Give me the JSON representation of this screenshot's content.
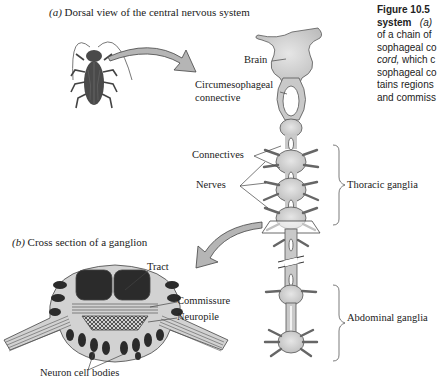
{
  "figure": {
    "number": "Figure 10.5",
    "caption_lines": [
      {
        "bold": "Figure 10.5",
        "text": ""
      },
      {
        "bold": "system",
        "italic": "(a)",
        "text": ""
      },
      {
        "text": "of a chain of"
      },
      {
        "text": "sophageal co"
      },
      {
        "italic": "cord,",
        "text": " which c"
      },
      {
        "text": "sophageal co"
      },
      {
        "text": "tains regions"
      },
      {
        "text": "and commiss"
      }
    ]
  },
  "panel_a": {
    "letter": "(a)",
    "title": "Dorsal view of the central nervous system",
    "labels": {
      "brain": "Brain",
      "circum_1": "Circumesophageal",
      "circum_2": "connective",
      "connectives": "Connectives",
      "nerves": "Nerves",
      "thoracic": "Thoracic ganglia",
      "abdominal": "Abdominal ganglia"
    }
  },
  "panel_b": {
    "letter": "(b)",
    "title": "Cross section of a ganglion",
    "labels": {
      "tract": "Tract",
      "commissure": "Commissure",
      "neuropile": "Neuropile",
      "neuron_cell_bodies": "Neuron cell bodies"
    }
  },
  "colors": {
    "tissue": "#c9c9c9",
    "outline": "#555555",
    "dark": "#2b2b2b",
    "insect": "#4a4a4a"
  }
}
